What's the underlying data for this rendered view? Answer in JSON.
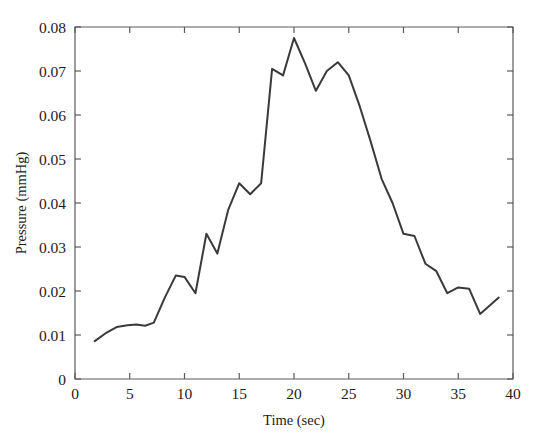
{
  "chart_data": {
    "type": "line",
    "title": "",
    "xlabel": "Time (sec)",
    "ylabel": "Pressure (mmHg)",
    "xlim": [
      0,
      40
    ],
    "ylim": [
      0,
      0.08
    ],
    "xticks": [
      0,
      5,
      10,
      15,
      20,
      25,
      30,
      35,
      40
    ],
    "xtick_labels": [
      "0",
      "5",
      "10",
      "15",
      "20",
      "25",
      "30",
      "35",
      "40"
    ],
    "yticks": [
      0,
      0.01,
      0.02,
      0.03,
      0.04,
      0.05,
      0.06,
      0.07,
      0.08
    ],
    "ytick_labels": [
      "0",
      "0.01",
      "0.02",
      "0.03",
      "0.04",
      "0.05",
      "0.06",
      "0.07",
      "0.08"
    ],
    "grid": false,
    "legend": null,
    "line_color": "#3a3a3a",
    "line_width": 2.0,
    "axes_color": "#5a5a5a",
    "background_color": "#ffffff",
    "series": [
      {
        "name": "Pressure",
        "x": [
          1.8,
          2.8,
          3.8,
          4.8,
          5.6,
          6.4,
          7.2,
          8.2,
          9.2,
          10.0,
          11.0,
          12.0,
          13.0,
          14.0,
          15.0,
          16.0,
          17.0,
          18.0,
          19.0,
          20.0,
          21.0,
          22.0,
          23.0,
          24.0,
          25.0,
          26.0,
          27.0,
          28.0,
          29.0,
          30.0,
          31.0,
          32.0,
          33.0,
          34.0,
          35.0,
          36.0,
          37.0,
          38.7
        ],
        "y": [
          0.0086,
          0.0104,
          0.0118,
          0.0122,
          0.0124,
          0.0121,
          0.0128,
          0.0185,
          0.0235,
          0.0232,
          0.0195,
          0.033,
          0.0285,
          0.0385,
          0.0445,
          0.042,
          0.0445,
          0.0705,
          0.069,
          0.0775,
          0.0718,
          0.0655,
          0.07,
          0.072,
          0.069,
          0.062,
          0.054,
          0.0455,
          0.04,
          0.033,
          0.0325,
          0.0262,
          0.0245,
          0.0195,
          0.0208,
          0.0205,
          0.0148,
          0.0185
        ]
      }
    ]
  }
}
